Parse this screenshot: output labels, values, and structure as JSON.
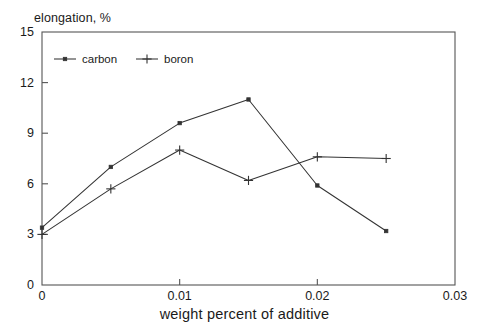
{
  "chart_data": {
    "type": "line",
    "title": "",
    "ylabel": "elongation, %",
    "xlabel": "weight percent of additive",
    "xlim": [
      0,
      0.03
    ],
    "ylim": [
      0,
      15
    ],
    "xticks": [
      "0",
      "0.01",
      "0.02",
      "0.03"
    ],
    "xtick_values": [
      0,
      0.01,
      0.02,
      0.03
    ],
    "yticks": [
      "0",
      "3",
      "6",
      "9",
      "12",
      "15"
    ],
    "ytick_values": [
      0,
      3,
      6,
      9,
      12,
      15
    ],
    "grid": false,
    "legend_position": "upper left inside",
    "x": [
      0,
      0.005,
      0.01,
      0.015,
      0.02,
      0.025
    ],
    "series": [
      {
        "name": "carbon",
        "marker": "square",
        "color": "#333333",
        "values": [
          3.4,
          7.0,
          9.6,
          11.0,
          5.9,
          3.2
        ]
      },
      {
        "name": "boron",
        "marker": "plus",
        "color": "#333333",
        "values": [
          3.0,
          5.7,
          8.0,
          6.2,
          7.6,
          7.5
        ]
      }
    ]
  },
  "legend": {
    "entries": [
      {
        "label": "carbon"
      },
      {
        "label": "boron"
      }
    ]
  },
  "colors": {
    "axis": "#555555",
    "line": "#333333",
    "text": "#1a1a1a",
    "background": "#ffffff"
  }
}
